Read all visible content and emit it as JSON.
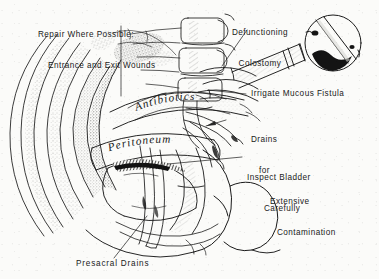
{
  "figure": {
    "background_color": "#fbfbf9",
    "ink_color": "#1a1a1a",
    "style": "hand-drawn line art with stippled shading"
  },
  "labels": {
    "repair_wounds": {
      "line1": "Repair Where Possible:",
      "line2": "Entrance and Exit Wounds"
    },
    "defunctioning_colostomy": {
      "line1": "Defunctioning",
      "line2": "Colostomy"
    },
    "irrigate_fistula": "Irrigate Mucous Fistula",
    "drains_contamination": {
      "line1": "Drains",
      "line2": "for",
      "line3": "Extensive",
      "line4": "Contamination"
    },
    "inspect_bladder": {
      "line1": "Inspect Bladder",
      "line2": "Carefully"
    },
    "presacral_drains": "Presacral Drains"
  },
  "script_labels": {
    "antibiotics": "Antibiotics",
    "peritoneum": "Peritoneum"
  },
  "anatomy_parts": [
    "abdominal-wall-layers",
    "lumbar-vertebrae",
    "peritoneal-cavity",
    "bowel-loops",
    "colostomy-stoma",
    "colostomy-pouch",
    "mucous-fistula",
    "bladder",
    "rectum",
    "sacrum",
    "presacral-space",
    "buttock-contour",
    "thigh-contour",
    "pelvic-drains"
  ],
  "leader_lines": [
    "repair-wounds-leader",
    "colostomy-leader",
    "irrigate-fistula-leader",
    "drains-leader",
    "bladder-leader",
    "presacral-drains-leader"
  ]
}
